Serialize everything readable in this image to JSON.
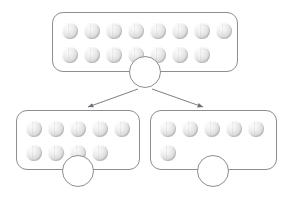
{
  "worksheet": {
    "type": "number-bond-decomposition",
    "whole_box": {
      "label": "whole",
      "total": 15,
      "rows": [
        8,
        7
      ],
      "answer_circle_value": ""
    },
    "part_boxes": [
      {
        "label": "part-left",
        "total": 9,
        "rows": [
          5,
          4
        ],
        "answer_circle_value": ""
      },
      {
        "label": "part-right",
        "total": 6,
        "rows": [
          5,
          1
        ],
        "answer_circle_value": ""
      }
    ],
    "arrows": [
      {
        "name": "arrow-to-left-part",
        "from": "whole-circle",
        "to": "part-left-box"
      },
      {
        "name": "arrow-to-right-part",
        "from": "whole-circle",
        "to": "part-right-box"
      }
    ],
    "colors": {
      "outline": "#8e8e92",
      "ball_light": "#fbfbfb",
      "ball_mid": "#dcdcdc",
      "ball_dark": "#b6b6b6",
      "background": "#ffffff",
      "arrow": "#6f6f73"
    }
  }
}
